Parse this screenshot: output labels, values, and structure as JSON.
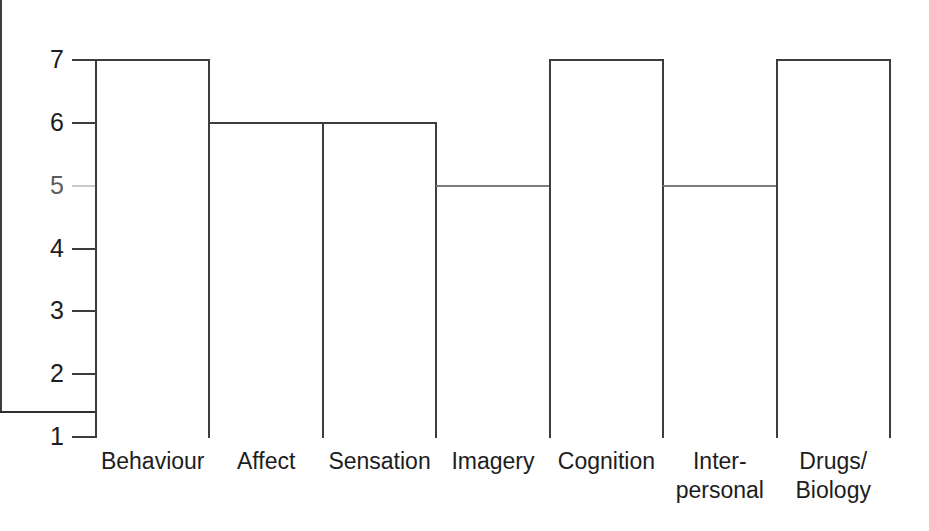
{
  "chart_data": {
    "type": "bar",
    "title": "",
    "subtitle": "",
    "xlabel": "",
    "ylabel": "",
    "categories": [
      "Behaviour",
      "Affect",
      "Sensation",
      "Imagery",
      "Cognition",
      "Inter-personal",
      "Drugs/Biology"
    ],
    "category_lines": [
      [
        "Behaviour"
      ],
      [
        "Affect"
      ],
      [
        "Sensation"
      ],
      [
        "Imagery"
      ],
      [
        "Cognition"
      ],
      [
        "Inter-",
        "personal"
      ],
      [
        "Drugs/",
        "Biology"
      ]
    ],
    "values": [
      7,
      6,
      6,
      5,
      7,
      5,
      7
    ],
    "ylim": [
      1,
      7
    ],
    "ytick_labels": [
      "7",
      "6",
      "5",
      "4",
      "3",
      "2",
      "1"
    ],
    "ytick_values": [
      7,
      6,
      5,
      4,
      3,
      2,
      1
    ],
    "grid": false,
    "legend": null,
    "legend_position": "none",
    "bar_fill": "#ffffff",
    "bar_edge_color": "#3d3d3d",
    "axis_color": "#3d3d3d",
    "text_color": "#1d1d1d",
    "background": "#ffffff"
  }
}
